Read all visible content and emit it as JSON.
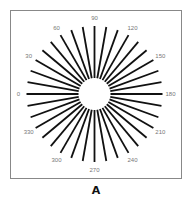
{
  "figure": {
    "caption": "A"
  },
  "chart_data": {
    "type": "radial-lines",
    "ray_count": 36,
    "ray_step_degrees": 10,
    "ray_color": "#111111",
    "frame_color": "#888888",
    "label_color": "#777777",
    "labels": [
      "0",
      "30",
      "60",
      "90",
      "120",
      "150",
      "180",
      "210",
      "240",
      "270",
      "300",
      "330"
    ],
    "label_angles": [
      0,
      30,
      60,
      90,
      120,
      150,
      180,
      210,
      240,
      270,
      300,
      330
    ]
  }
}
